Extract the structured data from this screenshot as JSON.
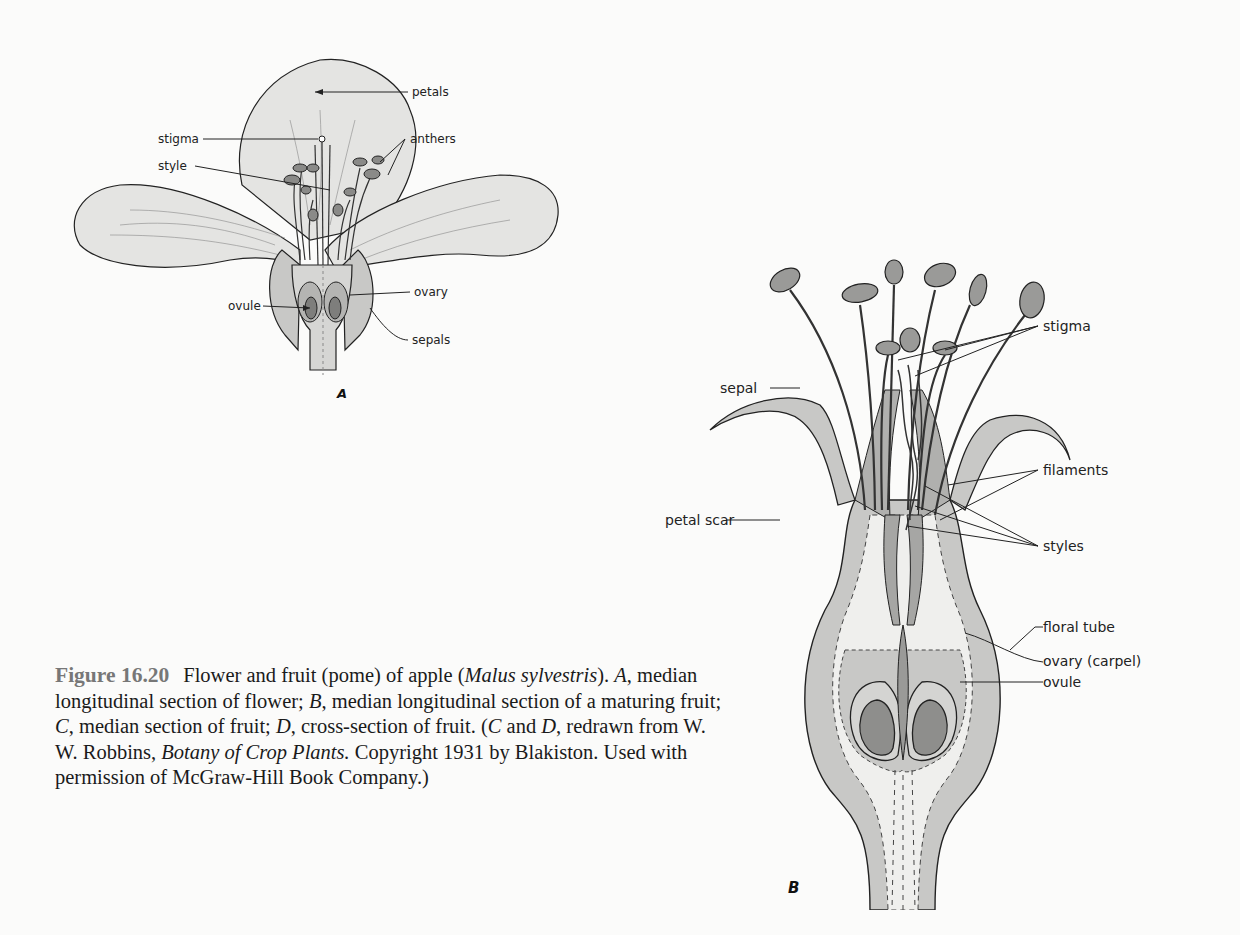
{
  "figure": {
    "number": "Figure 16.20",
    "caption_parts": [
      {
        "text": "Flower and fruit (pome) of apple (",
        "italic": false
      },
      {
        "text": "Malus sylvestris",
        "italic": true
      },
      {
        "text": "). ",
        "italic": false
      },
      {
        "text": "A",
        "italic": true
      },
      {
        "text": ", median longitudinal section of flower; ",
        "italic": false
      },
      {
        "text": "B",
        "italic": true
      },
      {
        "text": ", median longitudinal section of a maturing fruit; ",
        "italic": false
      },
      {
        "text": "C",
        "italic": true
      },
      {
        "text": ", median section of fruit; ",
        "italic": false
      },
      {
        "text": "D",
        "italic": true
      },
      {
        "text": ", cross-section of fruit. (",
        "italic": false
      },
      {
        "text": "C",
        "italic": true
      },
      {
        "text": " and ",
        "italic": false
      },
      {
        "text": "D",
        "italic": true
      },
      {
        "text": ", redrawn from W. W. Robbins, ",
        "italic": false
      },
      {
        "text": "Botany of Crop Plants.",
        "italic": true
      },
      {
        "text": " Copyright 1931 by Blakiston. Used with permission of McGraw-Hill Book Company.)",
        "italic": false
      }
    ]
  },
  "panelA": {
    "letter": "A",
    "labels": {
      "petals": "petals",
      "stigma": "stigma",
      "anthers": "anthers",
      "style": "style",
      "ovary": "ovary",
      "ovule": "ovule",
      "sepals": "sepals"
    }
  },
  "panelB": {
    "letter": "B",
    "labels": {
      "stigma": "stigma",
      "sepal": "sepal",
      "filaments": "filaments",
      "petal_scar": "petal scar",
      "styles": "styles",
      "floral_tube": "floral tube",
      "ovary_carpel": "ovary (carpel)",
      "ovule": "ovule"
    }
  },
  "colors": {
    "petal_fill": "#e4e4e2",
    "tissue_mid": "#c8c8c6",
    "tissue_dark": "#9a9a98",
    "ovule_fill": "#8e8e8c",
    "light_fill": "#efefed",
    "line": "#222222",
    "figno_gray": "#777777"
  }
}
